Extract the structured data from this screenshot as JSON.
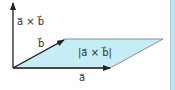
{
  "diagram": {
    "labels": {
      "cross_product": "a⃗ × b⃗",
      "vector_b": "b⃗",
      "area": "|a⃗ × b⃗|",
      "vector_a": "a⃗"
    },
    "colors": {
      "fill": "#c6ecf5",
      "line": "#222222",
      "outline": "#555555",
      "accent_bar": "#bfe3ef"
    }
  }
}
